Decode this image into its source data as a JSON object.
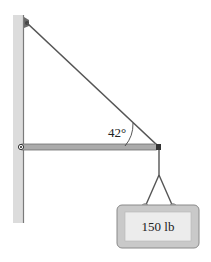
{
  "diagram": {
    "angle_label": "42°",
    "load_label": "150 lb",
    "elements": {
      "wall": "vertical wall",
      "cable": "diagonal support cable",
      "boom": "horizontal boom (strut)",
      "pivot": "hinge at wall",
      "rope": "hanging rope with sling",
      "load": "weight box"
    }
  },
  "colors": {
    "wall": "#d9d9d9",
    "wall_edge": "#8a8a8a",
    "boom": "#a8a8a8",
    "cable": "#555555",
    "box_outer": "#c8c8c8",
    "box_inner": "#e8e8e8"
  }
}
